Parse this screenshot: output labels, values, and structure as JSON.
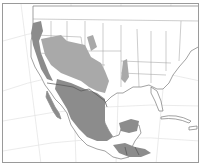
{
  "map": {
    "type": "species-range-map",
    "region": "North America (United States, Mexico, Central America, Caribbean)",
    "projection": "conic with graticule",
    "colors": {
      "background": "#ffffff",
      "land": "#ffffff",
      "boundary": "#7a7a7a",
      "graticule": "#e4e4e4",
      "range_dark": "#8c8c8c",
      "range_light": "#a9a9a9",
      "frame": "#9a9a9a"
    },
    "range_areas": [
      {
        "name": "Pacific coast California/Oregon",
        "shade": "dark"
      },
      {
        "name": "Great Basin / Southwest US",
        "shade": "light"
      },
      {
        "name": "Baja California",
        "shade": "dark"
      },
      {
        "name": "Mexico mainland",
        "shade": "dark"
      },
      {
        "name": "Texas / southern Plains",
        "shade": "light"
      },
      {
        "name": "Yucatan Peninsula",
        "shade": "dark"
      },
      {
        "name": "Central America (Guatemala-Honduras)",
        "shade": "dark"
      }
    ],
    "labels": []
  }
}
